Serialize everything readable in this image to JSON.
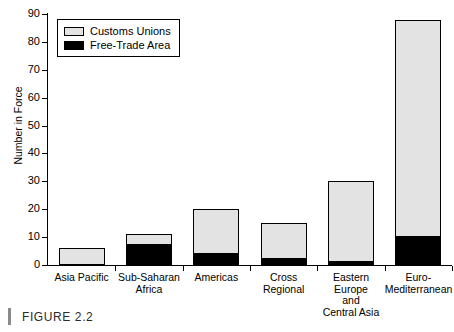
{
  "caption": {
    "label": "FIGURE 2.2"
  },
  "chart_data": {
    "type": "bar",
    "subtype": "stacked",
    "title": "",
    "xlabel": "",
    "ylabel": "Number in Force",
    "ylim": [
      0,
      90
    ],
    "ytick_step": 10,
    "yticks": [
      0,
      10,
      20,
      30,
      40,
      50,
      60,
      70,
      80,
      90
    ],
    "grid": false,
    "legend_position": "top-left",
    "categories": [
      "Asia Pacific",
      "Sub-Saharan\nAfrica",
      "Americas",
      "Cross\nRegional",
      "Eastern Europe\nand\nCentral Asia",
      "Euro-\nMediterranean"
    ],
    "series": [
      {
        "name": "Free-Trade Area",
        "color": "#000000",
        "values": [
          0,
          7,
          4,
          2,
          1,
          10
        ]
      },
      {
        "name": "Customs Unions",
        "color": "#e3e3e3",
        "values": [
          6,
          4,
          16,
          13,
          29,
          78
        ]
      }
    ],
    "totals": [
      6,
      11,
      20,
      15,
      30,
      88
    ]
  },
  "legend": {
    "items": [
      {
        "label": "Customs Unions",
        "swatch": "customs"
      },
      {
        "label": "Free-Trade Area",
        "swatch": "fta"
      }
    ]
  }
}
